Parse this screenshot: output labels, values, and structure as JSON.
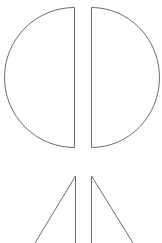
{
  "figure": {
    "width": 162,
    "height": 243,
    "background": "#ffffff",
    "stroke_color": "#6e6e6e",
    "stroke_width": 1,
    "shapes": [
      {
        "name": "left-half-circle",
        "type": "half-circle",
        "flat_x": 74,
        "top_y": 7,
        "bottom_y": 147,
        "outer_x": 6
      },
      {
        "name": "right-half-circle",
        "type": "half-circle",
        "flat_x": 91,
        "top_y": 7,
        "bottom_y": 147,
        "outer_x": 159
      },
      {
        "name": "left-half-triangle",
        "type": "right-triangle",
        "apex": [
          75,
          176
        ],
        "base_left": [
          35,
          243
        ],
        "base_right": [
          75,
          243
        ]
      },
      {
        "name": "right-half-triangle",
        "type": "right-triangle",
        "apex": [
          92,
          176
        ],
        "base_left": [
          92,
          243
        ],
        "base_right": [
          133,
          243
        ]
      }
    ]
  }
}
